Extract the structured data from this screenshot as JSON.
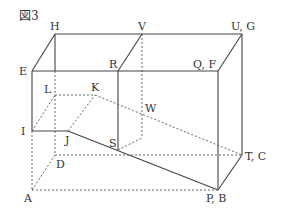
{
  "figure": {
    "title": "図3",
    "labels": {
      "H": "H",
      "V": "V",
      "UG": "U, G",
      "E": "E",
      "R": "R",
      "QF": "Q, F",
      "L": "L",
      "K": "K",
      "W": "W",
      "I": "I",
      "J": "J",
      "S": "S",
      "D": "D",
      "TC": "T, C",
      "A": "A",
      "PB": "P, B"
    }
  }
}
